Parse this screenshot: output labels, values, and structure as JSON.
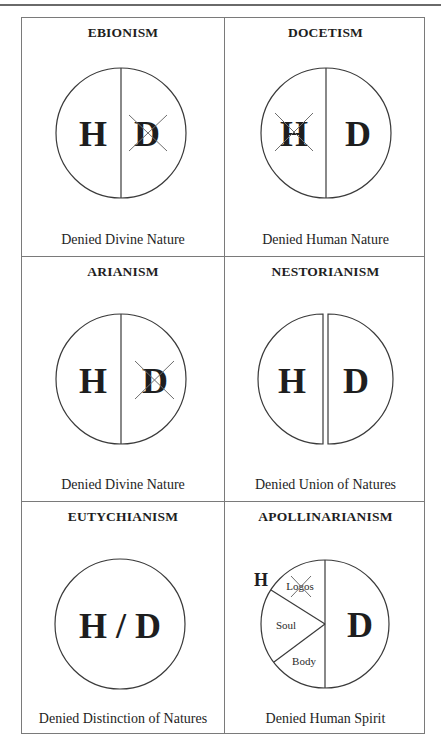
{
  "figure": {
    "cells": [
      {
        "id": "ebionism",
        "title": "EBIONISM",
        "caption": "Denied Divine Nature",
        "type": "split",
        "left_label": "H",
        "right_label": "D",
        "crossed": "D"
      },
      {
        "id": "docetism",
        "title": "DOCETISM",
        "caption": "Denied Human Nature",
        "type": "split",
        "left_label": "H",
        "right_label": "D",
        "crossed": "H"
      },
      {
        "id": "arianism",
        "title": "ARIANISM",
        "caption": "Denied Divine Nature",
        "type": "split",
        "left_label": "H",
        "right_label": "D",
        "crossed": "D"
      },
      {
        "id": "nestorianism",
        "title": "NESTORIANISM",
        "caption": "Denied Union of Natures",
        "type": "separated",
        "left_label": "H",
        "right_label": "D",
        "crossed": ""
      },
      {
        "id": "eutychianism",
        "title": "EUTYCHIANISM",
        "caption": "Denied Distinction of Natures",
        "type": "merged",
        "label": "H / D",
        "crossed": ""
      },
      {
        "id": "apollinarianism",
        "title": "APOLLINARIANISM",
        "caption": "Denied Human Spirit",
        "type": "segmented",
        "outer_label": "H",
        "segments": [
          "Logos",
          "Soul",
          "Body"
        ],
        "right_label": "D",
        "crossed": "Logos"
      }
    ],
    "colors": {
      "stroke": "#3a3a3a",
      "text": "#1e1e1e",
      "cross": "#6e6e6e",
      "border": "#7a7a7a"
    }
  }
}
